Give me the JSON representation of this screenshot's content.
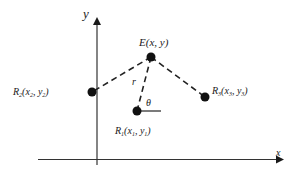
{
  "diagram": {
    "axes": {
      "x_label": "x",
      "y_label": "y"
    },
    "points": {
      "E": {
        "name": "E",
        "coords": "(x, y)"
      },
      "R1": {
        "name": "R",
        "sub": "1",
        "open": "(",
        "x": "x",
        "xsub": "1",
        "sep": ", ",
        "y": "y",
        "ysub": "1",
        "close": ")"
      },
      "R2": {
        "name": "R",
        "sub": "2",
        "open": "(",
        "x": "x",
        "xsub": "2",
        "sep": ", ",
        "y": "y",
        "ysub": "2",
        "close": ")"
      },
      "R3": {
        "name": "R",
        "sub": "3",
        "open": "(",
        "x": "x",
        "xsub": "3",
        "sep": ", ",
        "y": "y",
        "ysub": "3",
        "close": ")"
      }
    },
    "distance_label": "r",
    "angle_label": "θ",
    "colors": {
      "ink": "#1a1a1a",
      "background": "#ffffff"
    }
  }
}
